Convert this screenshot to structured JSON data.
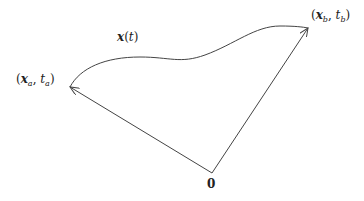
{
  "diagram": {
    "labels": {
      "path": {
        "var": "x",
        "arg": "t"
      },
      "start": {
        "var": "x",
        "sub": "a",
        "time": "t",
        "tsub": "a"
      },
      "end": {
        "var": "x",
        "sub": "b",
        "time": "t",
        "tsub": "b"
      },
      "origin": "0"
    },
    "points": {
      "origin": [
        212,
        173
      ],
      "start": [
        70,
        87
      ],
      "end": [
        308,
        28
      ]
    },
    "colors": {
      "stroke": "#444444",
      "text": "#222222"
    }
  }
}
